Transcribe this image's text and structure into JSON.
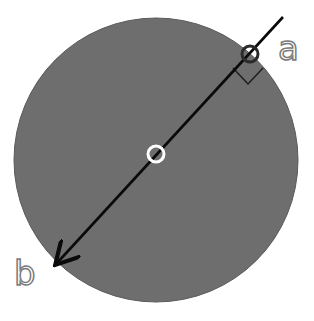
{
  "diagram": {
    "labels": {
      "a": "a",
      "b": "b"
    },
    "colors": {
      "background": "#ffffff",
      "disk_fill": "#6e6e6e",
      "disk_edge": "#5a5a5a",
      "line": "#0a0a0a",
      "center_marker": "#ffffff",
      "point_a_marker": "#2a2a2a",
      "label_outline": "#7a7a7a"
    },
    "elements": [
      {
        "type": "disk",
        "center": [
          156,
          158
        ],
        "radius": 142
      },
      {
        "type": "center-marker",
        "center": [
          156,
          154
        ],
        "radius": 8
      },
      {
        "type": "arrow-line",
        "from": [
          283,
          17
        ],
        "to": [
          55,
          265
        ]
      },
      {
        "type": "point-a-marker",
        "center": [
          250,
          55
        ],
        "radius": 9
      },
      {
        "type": "right-angle-marker",
        "at": [
          250,
          55
        ]
      }
    ]
  }
}
